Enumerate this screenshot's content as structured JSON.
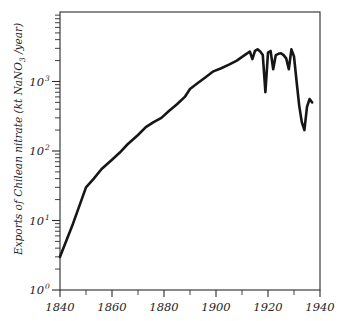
{
  "chart_data": {
    "type": "line",
    "title": "",
    "subtitle": "",
    "xlabel": "",
    "ylabel": "Exports of Chilean nitrate (kt NaNO3 /year)",
    "ylabel_parts": {
      "lead": "Exports of Chilean nitrate (kt NaNO",
      "subscript": "3",
      "tail": " /year)"
    },
    "yscale": "log",
    "xscale": "linear",
    "xlim": [
      1840,
      1940
    ],
    "ylim": [
      1,
      4000
    ],
    "grid": false,
    "legend": null,
    "legend_position": "none",
    "x_tick_labels": [
      "1840",
      "1860",
      "1880",
      "1900",
      "1920",
      "1940"
    ],
    "x_ticks_major": [
      1840,
      1860,
      1880,
      1900,
      1920,
      1940
    ],
    "x_ticks_minor": [
      1850,
      1870,
      1890,
      1910,
      1930
    ],
    "y_tick_labels": [
      "10",
      "10",
      "10",
      "10"
    ],
    "y_tick_exponents": [
      "0",
      "1",
      "2",
      "3"
    ],
    "y_ticks_major": [
      1,
      10,
      100,
      1000
    ],
    "y_minor_multipliers": [
      2,
      3,
      4,
      5,
      6,
      7,
      8,
      9
    ],
    "series": [
      {
        "name": "Exports of Chilean nitrate",
        "color": "#161616",
        "x": [
          1840,
          1845,
          1850,
          1853,
          1856,
          1860,
          1863,
          1866,
          1870,
          1873,
          1876,
          1879,
          1882,
          1885,
          1888,
          1890,
          1893,
          1896,
          1899,
          1902,
          1905,
          1908,
          1911,
          1913,
          1914,
          1915,
          1916,
          1917,
          1918,
          1919,
          1920,
          1921,
          1922,
          1923,
          1924,
          1925,
          1926,
          1927,
          1928,
          1929,
          1930,
          1931,
          1932,
          1933,
          1934,
          1935,
          1936,
          1937
        ],
        "values": [
          3,
          9,
          30,
          40,
          55,
          75,
          95,
          125,
          170,
          220,
          260,
          300,
          380,
          470,
          600,
          780,
          950,
          1150,
          1400,
          1550,
          1750,
          2000,
          2400,
          2700,
          2100,
          2750,
          2900,
          2700,
          2400,
          700,
          2600,
          2750,
          1500,
          2400,
          2500,
          2550,
          2400,
          2150,
          1500,
          2900,
          2300,
          1000,
          450,
          260,
          200,
          430,
          560,
          500
        ]
      }
    ],
    "annotations": []
  },
  "figure": {
    "background_color": "#ffffff",
    "line_color": "#161616",
    "axis_color": "#2b2b2b",
    "plot_left": 60,
    "plot_right": 320,
    "plot_top": 12,
    "plot_bottom": 290
  }
}
